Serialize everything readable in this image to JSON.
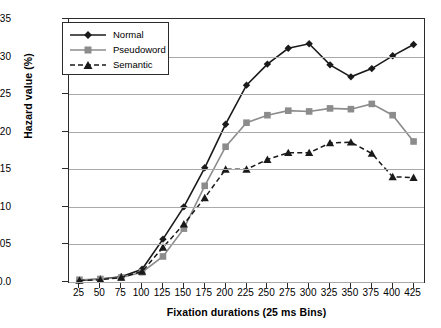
{
  "chart_data": {
    "type": "line",
    "title": "",
    "xlabel": "Fixation durations (25 ms Bins)",
    "ylabel": "Hazard value (%)",
    "categories": [
      25,
      50,
      75,
      100,
      125,
      150,
      175,
      200,
      225,
      250,
      275,
      300,
      325,
      350,
      375,
      400,
      425
    ],
    "xtick_labels": [
      "25",
      "50",
      "75",
      "100",
      "125",
      "150",
      "175",
      "200",
      "225",
      "250",
      "275",
      "300",
      "325",
      "350",
      "375",
      "400",
      "425"
    ],
    "ytick_labels": [
      "0.0",
      "0.05",
      "0.10",
      "0.15",
      "0.20",
      "0.25",
      "0.30",
      "0.35"
    ],
    "ytick_values": [
      0.0,
      0.05,
      0.1,
      0.15,
      0.2,
      0.25,
      0.3,
      0.35
    ],
    "ylim": [
      0.0,
      0.35
    ],
    "grid": "horizontal",
    "legend_position": "top-left",
    "series": [
      {
        "name": "Normal",
        "marker": "diamond",
        "line_style": "solid",
        "color": "#1a1a1a",
        "values": [
          0.002,
          0.004,
          0.007,
          0.017,
          0.057,
          0.1,
          0.152,
          0.21,
          0.262,
          0.29,
          0.311,
          0.317,
          0.289,
          0.273,
          0.284,
          0.301,
          0.316
        ]
      },
      {
        "name": "Pseudoword",
        "marker": "square",
        "line_style": "solid",
        "color": "#8c8c8c",
        "values": [
          0.003,
          0.004,
          0.006,
          0.013,
          0.034,
          0.071,
          0.128,
          0.18,
          0.212,
          0.222,
          0.228,
          0.227,
          0.231,
          0.23,
          0.237,
          0.222,
          0.187
        ]
      },
      {
        "name": "Semantic",
        "marker": "triangle",
        "line_style": "dashed",
        "color": "#1a1a1a",
        "values": [
          0.002,
          0.003,
          0.006,
          0.014,
          0.046,
          0.077,
          0.112,
          0.15,
          0.15,
          0.163,
          0.172,
          0.172,
          0.185,
          0.186,
          0.171,
          0.14,
          0.139
        ]
      }
    ]
  },
  "legend": {
    "entries": [
      {
        "label": "Normal"
      },
      {
        "label": "Pseudoword"
      },
      {
        "label": "Semantic"
      }
    ]
  }
}
